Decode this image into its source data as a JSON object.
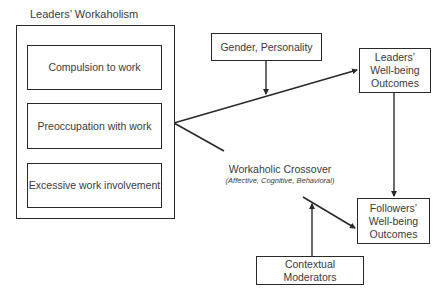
{
  "diagram": {
    "leaders_workaholism": {
      "title": "Leaders’ Workaholism",
      "components": [
        {
          "label": "Compulsion to work"
        },
        {
          "label": "Preoccupation with work"
        },
        {
          "label": "Excessive work involvement"
        }
      ]
    },
    "moderator_individual": {
      "label": "Gender, Personality"
    },
    "leaders_outcomes": {
      "line1": "Leaders’",
      "line2": "Well-being",
      "line3": "Outcomes"
    },
    "crossover": {
      "label": "Workaholic Crossover",
      "sublabel": "(Affective, Cognitive, Behavioral)"
    },
    "followers_outcomes": {
      "line1": "Followers’",
      "line2": "Well-being",
      "line3": "Outcomes"
    },
    "moderator_contextual": {
      "line1": "Contextual",
      "line2": "Moderators"
    },
    "colors": {
      "line": "#2a2a2a",
      "text": "#3a3a3a",
      "background": "#ffffff"
    }
  }
}
